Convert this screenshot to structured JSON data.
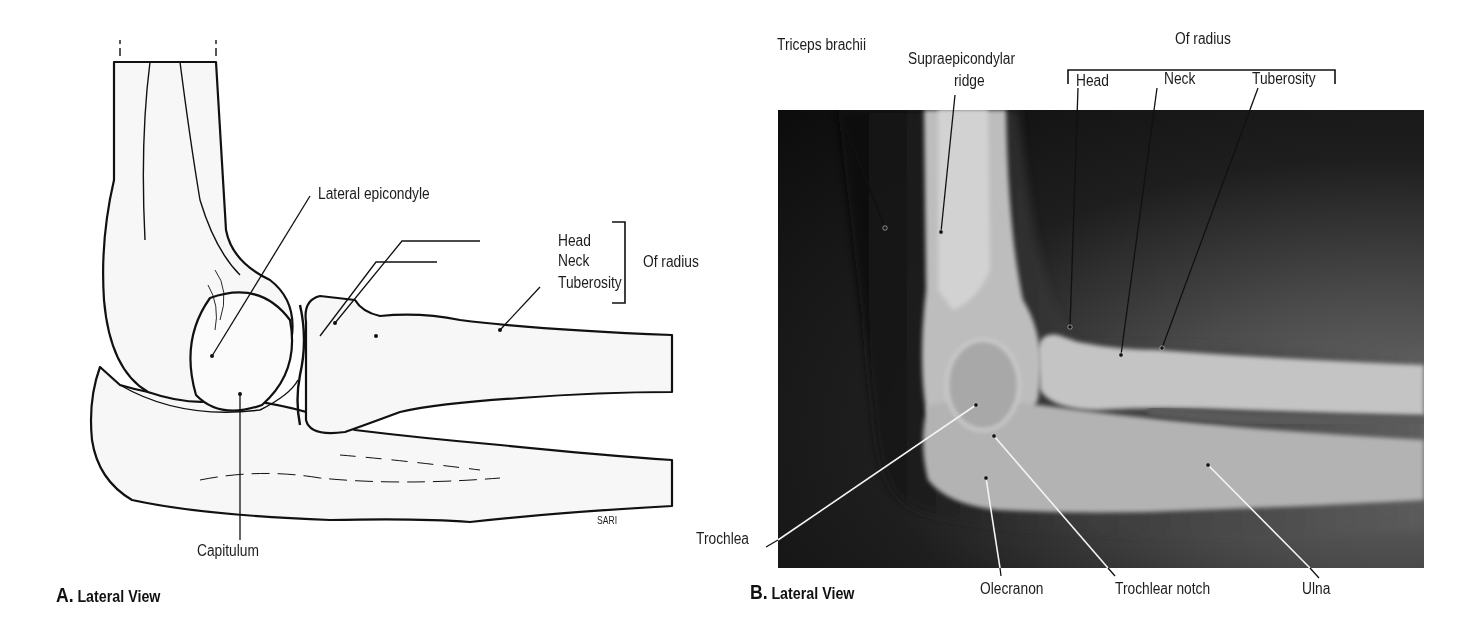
{
  "figure": {
    "panel_a": {
      "caption_letter": "A.",
      "caption_text": "Lateral View",
      "artist_signature": "SARI",
      "labels": {
        "lateral_epicondyle": "Lateral epicondyle",
        "head": "Head",
        "neck": "Neck",
        "tuberosity": "Tuberosity",
        "of_radius": "Of radius",
        "capitulum": "Capitulum"
      }
    },
    "panel_b": {
      "caption_letter": "B.",
      "caption_text": "Lateral View",
      "labels": {
        "triceps_brachii": "Triceps brachii",
        "supraepicondylar_ridge_line1": "Supraepicondylar",
        "supraepicondylar_ridge_line2": "ridge",
        "of_radius": "Of radius",
        "head": "Head",
        "neck": "Neck",
        "tuberosity": "Tuberosity",
        "trochlea": "Trochlea",
        "olecranon": "Olecranon",
        "trochlear_notch": "Trochlear notch",
        "ulna": "Ulna"
      }
    }
  }
}
